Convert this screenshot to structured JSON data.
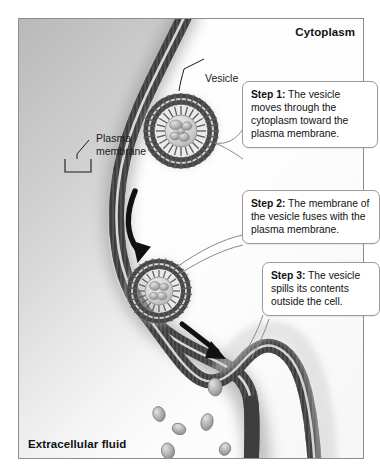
{
  "figure": {
    "type": "biology-diagram"
  },
  "regions": {
    "cytoplasm_label": "Cytoplasm",
    "extracellular_label": "Extracellular fluid"
  },
  "structure_labels": {
    "vesicle": "Vesicle",
    "plasma_membrane": "Plasma\nmembrane",
    "plasma_membrane_line1": "Plasma",
    "plasma_membrane_line2": "membrane"
  },
  "steps": [
    {
      "id": "step-1",
      "label": "Step 1:",
      "text": "The vesicle moves through the cytoplasm toward the plasma membrane.",
      "full": "Step 1: The vesicle moves through the cytoplasm toward the plasma membrane."
    },
    {
      "id": "step-2",
      "label": "Step 2:",
      "text": "The membrane of the vesicle fuses with the plasma membrane.",
      "full": "Step 2: The membrane of the vesicle fuses with the plasma membrane."
    },
    {
      "id": "step-3",
      "label": "Step 3:",
      "text": "The vesicle spills its contents outside the cell.",
      "full": "Step 3: The vesicle spills its contents outside the cell."
    }
  ],
  "colors": {
    "membrane_dark": "#4a4a4a",
    "membrane_mid": "#7e7e7e",
    "membrane_light": "#b4b4b4",
    "extracellular_gray": "#c4c4c4",
    "cytoplasm_white": "#fbfbfb",
    "cargo_gray": "#9b9b9b",
    "arrow_black": "#111111",
    "border_gray": "#8d8d8d",
    "callout_border": "#9a9a9a",
    "text_black": "#111111"
  },
  "graphics": {
    "arrows": [
      {
        "name": "arrow-step1-to-step2",
        "style": "curved",
        "direction": "down-right"
      },
      {
        "name": "arrow-step2-to-step3",
        "style": "straight",
        "direction": "down-right"
      }
    ],
    "vesicles": [
      {
        "name": "vesicle-in-cytoplasm",
        "state": "free",
        "cargo_count": 5
      },
      {
        "name": "vesicle-fusing",
        "state": "fusing-with-membrane",
        "cargo_count": 4
      }
    ],
    "released_particles": 6
  }
}
